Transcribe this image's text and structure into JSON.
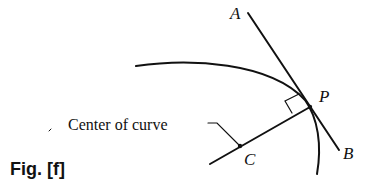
{
  "figure": {
    "caption": "Fig. [f]",
    "labels": {
      "A": "A",
      "B": "B",
      "P": "P",
      "C": "C",
      "center_of_curve": "Center of curve"
    },
    "elements": {
      "curve": "circular arc passing through P",
      "tangent_line": "line AB tangent to curve at P",
      "radius_line": "line from center C to P, perpendicular to AB",
      "right_angle_marker": "square at P between radius and tangent"
    },
    "colors": {
      "ink": "#111111",
      "background": "#ffffff"
    }
  }
}
